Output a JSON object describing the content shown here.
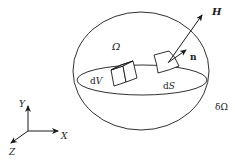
{
  "diagram": {
    "type": "control-volume-sketch",
    "colors": {
      "stroke": "#1a1a1a",
      "background": "#ffffff"
    },
    "labels": {
      "domain": "Ω",
      "boundary": "δΩ",
      "volume_element_d": "d",
      "volume_element_v": "V",
      "surface_element_d": "d",
      "surface_element_s": "S",
      "normal": "n",
      "vector_field": "H"
    },
    "axes": {
      "x": "X",
      "y": "Y",
      "z": "Z"
    }
  }
}
